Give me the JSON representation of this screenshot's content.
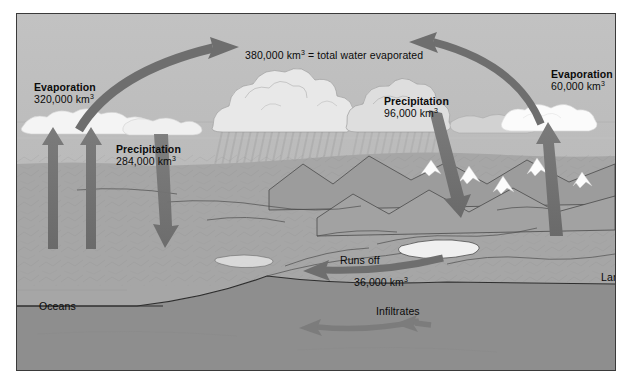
{
  "diagram": {
    "unit": "km3",
    "colors": {
      "sky": "#b9b9b9",
      "ocean_surface": "#d8d8d8",
      "ocean_deep": "#a8a8a8",
      "land_rock": "#9a9a9a",
      "bedrock": "#8f8f8f",
      "arrow": "#6e6e6e",
      "cloud": "#f2f2f2",
      "outline": "#3a3a3a",
      "text": "#0b0b0b"
    },
    "labels": {
      "evaporation_ocean": {
        "title": "Evaporation",
        "value": "320,000 km",
        "exp": "3"
      },
      "precipitation_ocean": {
        "title": "Precipitation",
        "value": "284,000 km",
        "exp": "3"
      },
      "precipitation_land": {
        "title": "Precipitation",
        "value": "96,000 km",
        "exp": "3"
      },
      "evaporation_land": {
        "title": "Evaporation",
        "value": "60,000 km",
        "exp": "3"
      },
      "total_evaporated": {
        "value": "380,000 km",
        "exp": "3",
        "suffix": "= total water evaporated"
      },
      "runs_off": {
        "title": "Runs off",
        "value": "36,000 km",
        "exp": "3"
      },
      "infiltrates": {
        "title": "Infiltrates"
      },
      "oceans": {
        "title": "Oceans"
      },
      "land": {
        "title": "Land"
      }
    },
    "flows": [
      {
        "name": "evaporation-ocean-arrow-1",
        "from": "ocean",
        "to": "cloud",
        "direction": "up"
      },
      {
        "name": "evaporation-ocean-arrow-2",
        "from": "ocean",
        "to": "cloud",
        "direction": "up"
      },
      {
        "name": "transport-ocean-to-land-arrow",
        "from": "ocean-cloud",
        "to": "land",
        "direction": "right"
      },
      {
        "name": "transport-land-to-ocean-arrow",
        "from": "land-cloud",
        "to": "ocean",
        "direction": "left"
      },
      {
        "name": "precipitation-ocean-arrow",
        "from": "cloud",
        "to": "ocean",
        "direction": "down"
      },
      {
        "name": "precipitation-land-arrow",
        "from": "cloud",
        "to": "land",
        "direction": "down"
      },
      {
        "name": "evaporation-land-arrow",
        "from": "land",
        "to": "cloud",
        "direction": "up"
      },
      {
        "name": "runoff-arrow",
        "from": "land",
        "to": "ocean",
        "direction": "left"
      },
      {
        "name": "infiltration-arrow-1",
        "from": "land",
        "to": "groundwater",
        "direction": "left"
      },
      {
        "name": "infiltration-arrow-2",
        "from": "land",
        "to": "groundwater",
        "direction": "left"
      }
    ]
  }
}
